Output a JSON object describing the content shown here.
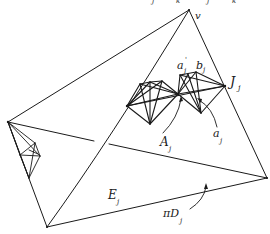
{
  "diagram": {
    "stroke_color": "#1a1a1a",
    "background": "#ffffff",
    "top_cutoff_text": [
      "j",
      "k",
      "j",
      "k"
    ],
    "labels": {
      "v": {
        "main": "v",
        "sub": ""
      },
      "a_prime": {
        "main": "a",
        "sup": "'",
        "sub": "j"
      },
      "b": {
        "main": "b",
        "sub": "j"
      },
      "J": {
        "main": "J",
        "sub": "j"
      },
      "A": {
        "main": "A",
        "sub": "j"
      },
      "a": {
        "main": "a",
        "sub": "j"
      },
      "E": {
        "main": "E",
        "sub": "j"
      },
      "piD": {
        "main": "πD",
        "sub": "j"
      }
    }
  }
}
